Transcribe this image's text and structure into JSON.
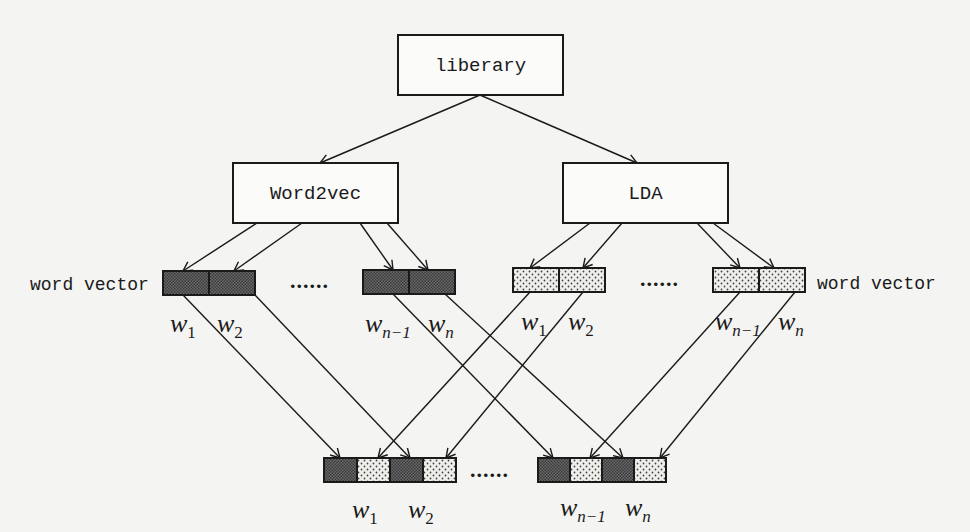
{
  "diagram": {
    "root": {
      "label": "liberary"
    },
    "branches": [
      {
        "id": "word2vec",
        "label": "Word2vec",
        "pattern": "dark-checker"
      },
      {
        "id": "lda",
        "label": "LDA",
        "pattern": "light-dotted"
      }
    ],
    "side_labels": {
      "left": "word vector",
      "right": "word vector"
    },
    "ellipsis": "......",
    "word_labels": {
      "w1": {
        "base": "w",
        "sub": "1"
      },
      "w2": {
        "base": "w",
        "sub": "2"
      },
      "wn_1": {
        "base": "w",
        "sub": "n−1"
      },
      "wn": {
        "base": "w",
        "sub": "n"
      }
    },
    "layers": [
      "Corpus (liberary)",
      "Models: Word2vec, LDA",
      "Word vectors w1, w2, ..., wn-1, wn from each model",
      "Concatenated vectors: [Word2vec wi | LDA wi] for i = 1..n"
    ],
    "colors": {
      "background": "#f4f4f2",
      "stroke": "#1a1a1a",
      "dark_fill": "#5a5a5a",
      "light_fill": "#ededed"
    }
  }
}
